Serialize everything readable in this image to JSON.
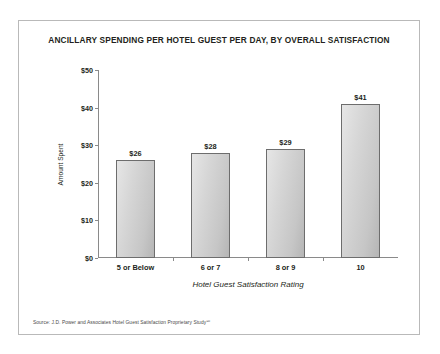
{
  "chart_data": {
    "type": "bar",
    "title": "ANCILLARY SPENDING PER HOTEL GUEST PER DAY, BY OVERALL SATISFACTION",
    "xlabel": "Hotel Guest Satisfaction Rating",
    "ylabel": "Amount Spent",
    "categories": [
      "5 or Below",
      "6 or 7",
      "8 or 9",
      "10"
    ],
    "values": [
      26,
      28,
      29,
      41
    ],
    "value_labels": [
      "$26",
      "$28",
      "$29",
      "$41"
    ],
    "ylim": [
      0,
      50
    ],
    "ytick_values": [
      0,
      10,
      20,
      30,
      40,
      50
    ],
    "ytick_labels": [
      "$0",
      "$10",
      "$20",
      "$30",
      "$40",
      "$50"
    ],
    "grid": false,
    "legend": "none",
    "bar_fill_light": "#e6e6e6",
    "bar_fill_dark": "#b5b5b5",
    "bar_edge_color": "#6d6d6d",
    "axis_color": "#8a8a8a",
    "text_color": "#231f20"
  },
  "source_note": "Source: J.D. Power and Associates Hotel Guest Satisfaction Proprietary Study℠"
}
